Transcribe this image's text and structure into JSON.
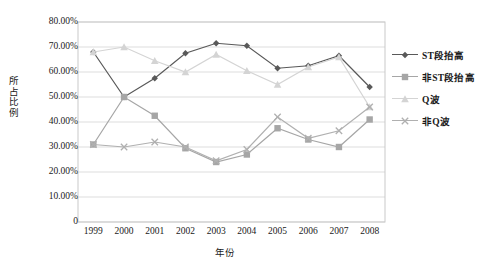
{
  "chart_data": {
    "type": "line",
    "title": "",
    "xlabel": "年份",
    "ylabel": "所占比例",
    "categories": [
      "1999",
      "2000",
      "2001",
      "2002",
      "2003",
      "2004",
      "2005",
      "2006",
      "2007",
      "2008"
    ],
    "ytick_labels": [
      "80.00%",
      "70.00%",
      "60.00%",
      "50.00%",
      "40.00%",
      "30.00%",
      "20.00%",
      "10.00%",
      "0"
    ],
    "ytick_values": [
      80,
      70,
      60,
      50,
      40,
      30,
      20,
      10,
      0
    ],
    "ylim": [
      0,
      80
    ],
    "grid": true,
    "legend_position": "right",
    "series": [
      {
        "name": "ST段抬高",
        "color": "#595959",
        "marker": "diamond",
        "values": [
          68.0,
          50.0,
          57.5,
          67.5,
          71.5,
          70.5,
          61.5,
          62.5,
          66.5,
          54.0
        ]
      },
      {
        "name": "非ST段抬高",
        "color": "#a6a6a6",
        "marker": "square",
        "values": [
          31.0,
          50.0,
          42.5,
          29.5,
          24.0,
          27.0,
          37.5,
          33.0,
          30.0,
          41.0
        ]
      },
      {
        "name": "Q波",
        "color": "#d4d4d4",
        "marker": "triangle",
        "values": [
          68.0,
          70.0,
          64.5,
          60.0,
          67.0,
          60.5,
          55.0,
          62.0,
          66.0,
          46.0
        ]
      },
      {
        "name": "非Q波",
        "color": "#b0b0b0",
        "marker": "cross",
        "values": [
          31.0,
          30.0,
          32.0,
          30.0,
          24.5,
          29.0,
          42.0,
          33.5,
          36.5,
          46.0
        ]
      }
    ]
  },
  "axis": {
    "y_label_text": "所占比例",
    "x_label_text": "年份"
  },
  "colors": {
    "plot_border": "#c9c9c9",
    "gridline": "#d9d9d9",
    "background": "#ffffff"
  }
}
